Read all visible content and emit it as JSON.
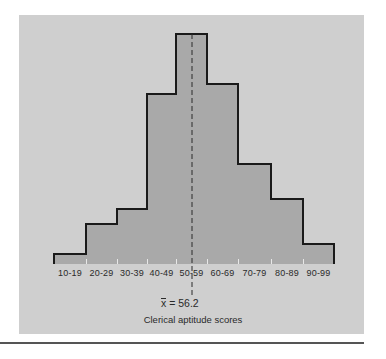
{
  "chart_data": {
    "type": "bar",
    "title": "",
    "xlabel": "Clerical aptitude scores",
    "ylabel": "",
    "categories": [
      "10-19",
      "20-29",
      "30-39",
      "40-49",
      "50-59",
      "60-69",
      "70-79",
      "80-89",
      "90-99"
    ],
    "values": [
      2,
      8,
      11,
      34,
      46,
      36,
      20,
      13,
      4
    ],
    "value_note": "relative frequencies estimated from bar heights (no y-axis shown)",
    "annotations": [
      {
        "type": "mean-line",
        "label": "x̄ = 56.2",
        "value": 56.2,
        "style": "dashed vertical"
      }
    ],
    "grid": false,
    "legend": null,
    "colors": {
      "panel_bg": "#cfcfcf",
      "bar_fill": "#a9a9a9",
      "outline": "#1a1a1a"
    }
  },
  "labels": {
    "categories": [
      "10-19",
      "20-29",
      "30-39",
      "40-49",
      "50-59",
      "60-69",
      "70-79",
      "80-89",
      "90-99"
    ],
    "mean_symbol": "x",
    "mean_text": " = 56.2",
    "caption": "Clerical aptitude scores"
  }
}
